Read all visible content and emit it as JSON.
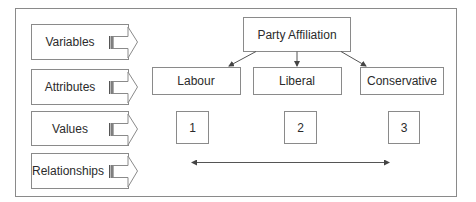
{
  "legend": {
    "items": [
      {
        "label": "Variables"
      },
      {
        "label": "Attributes"
      },
      {
        "label": "Values"
      },
      {
        "label": "Relationships"
      }
    ]
  },
  "variable": {
    "label": "Party Affiliation"
  },
  "attributes": [
    {
      "label": "Labour"
    },
    {
      "label": "Liberal"
    },
    {
      "label": "Conservative"
    }
  ],
  "values": [
    {
      "label": "1"
    },
    {
      "label": "2"
    },
    {
      "label": "3"
    }
  ],
  "relationship": {
    "type": "double-headed-arrow"
  },
  "colors": {
    "stroke": "#8a8a8a",
    "text": "#2b2b2b",
    "arrow": "#555555"
  }
}
